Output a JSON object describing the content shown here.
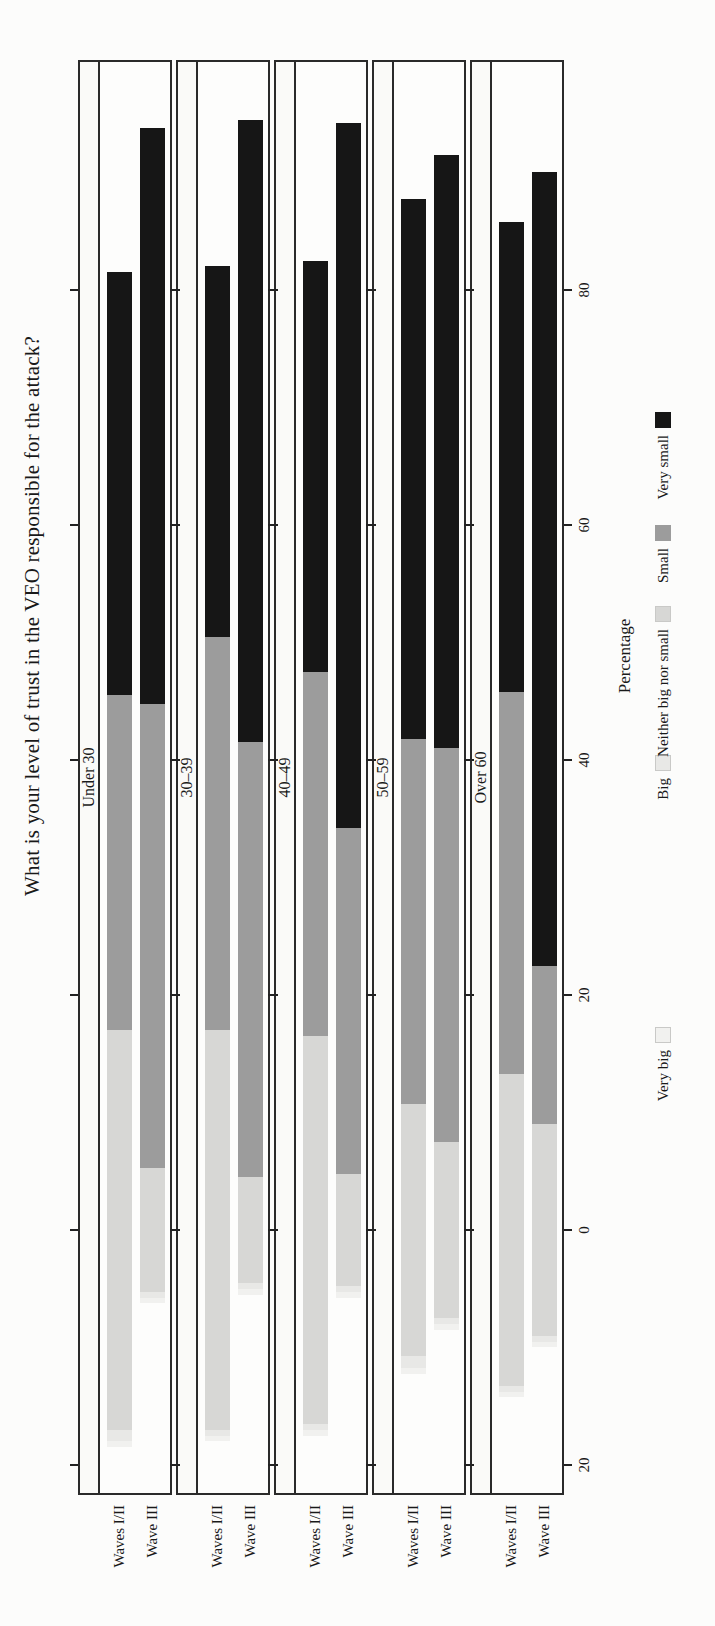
{
  "chart_data": {
    "type": "bar",
    "variant": "diverging stacked horizontal Likert chart; whole figure printed rotated 90 degrees counter-clockwise on a portrait book page",
    "title": "What is your level of trust in the VEO responsible for the attack?",
    "xlabel": "Percentage",
    "xlim": [
      -22.5,
      100
    ],
    "grid": false,
    "xticks": [
      {
        "value": 80,
        "label": "80"
      },
      {
        "value": 60,
        "label": "60"
      },
      {
        "value": 40,
        "label": "40"
      },
      {
        "value": 20,
        "label": "20"
      },
      {
        "value": 0,
        "label": "0"
      },
      {
        "value": -20,
        "label": "20"
      }
    ],
    "categories": [
      {
        "name": "Very big",
        "color": "#f1f1ef"
      },
      {
        "name": "Big",
        "color": "#e8e8e6"
      },
      {
        "name": "Neither big nor small",
        "color": "#d7d7d5"
      },
      {
        "name": "Small",
        "color": "#9c9c9c"
      },
      {
        "name": "Very small",
        "color": "#161616"
      }
    ],
    "centering": "diverging at 0: Very big + Big + half of Neither plotted on the negative side",
    "legend_order": [
      "Very big",
      "Big",
      "Neither big nor small",
      "Small",
      "Very small"
    ],
    "groups": [
      {
        "label": "Under 30",
        "bars": [
          {
            "label": "Waves I/II",
            "values": [
              0.5,
              1.0,
              34.0,
              28.5,
              36.0
            ]
          },
          {
            "label": "Wave III",
            "values": [
              0.5,
              0.5,
              10.5,
              39.5,
              49.0
            ]
          }
        ]
      },
      {
        "label": "30–39",
        "bars": [
          {
            "label": "Waves I/II",
            "values": [
              0.5,
              0.5,
              34.0,
              33.5,
              31.5
            ]
          },
          {
            "label": "Wave III",
            "values": [
              0.5,
              0.5,
              9.0,
              37.0,
              53.0
            ]
          }
        ]
      },
      {
        "label": "40–49",
        "bars": [
          {
            "label": "Waves I/II",
            "values": [
              0.5,
              0.5,
              33.0,
              31.0,
              35.0
            ]
          },
          {
            "label": "Wave III",
            "values": [
              0.5,
              0.5,
              9.5,
              29.5,
              60.0
            ]
          }
        ]
      },
      {
        "label": "50–59",
        "bars": [
          {
            "label": "Waves I/II",
            "values": [
              0.5,
              1.0,
              21.5,
              31.0,
              46.0
            ]
          },
          {
            "label": "Wave III",
            "values": [
              0.5,
              0.5,
              15.0,
              33.5,
              50.5
            ]
          }
        ]
      },
      {
        "label": "Over 60",
        "bars": [
          {
            "label": "Waves I/II",
            "values": [
              0.5,
              0.5,
              26.5,
              32.5,
              40.0
            ]
          },
          {
            "label": "Wave III",
            "values": [
              0.5,
              0.5,
              18.0,
              13.5,
              67.5
            ]
          }
        ]
      }
    ]
  }
}
